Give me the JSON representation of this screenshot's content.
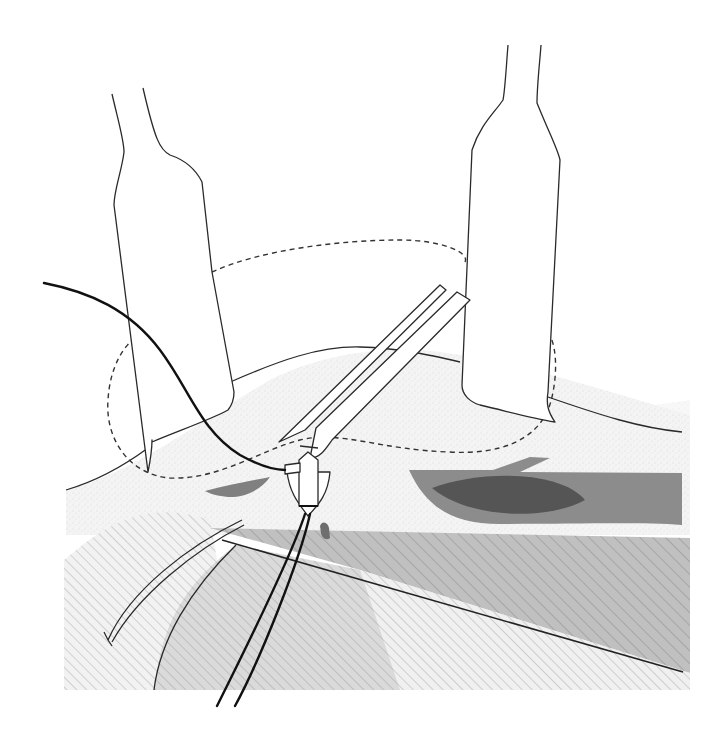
{
  "figure": {
    "type": "surgical-technique-illustration",
    "elements": {
      "left_retractor": "retractor",
      "right_retractor": "retractor",
      "forceps": "forceps",
      "anchor": "suture-anchor",
      "suture": "suture-thread",
      "incision_outline": "dashed-incision-outline",
      "needle": "curved-needle"
    },
    "layers": [
      {
        "name": "surface-tissue",
        "fill": "stippled",
        "color": "#f1f1f1"
      },
      {
        "name": "deep-layer-dark-band",
        "fill": "hatched",
        "color": "#b9b9b9"
      },
      {
        "name": "deep-layer-light",
        "fill": "hatched",
        "color": "#dcdcdc"
      },
      {
        "name": "lesion-outer",
        "fill": "solid",
        "color": "#8a8a8a"
      },
      {
        "name": "lesion-inner",
        "fill": "solid",
        "color": "#555555"
      }
    ],
    "colors": {
      "outline": "#2a2a2a",
      "thread": "#111111",
      "background": "#ffffff"
    }
  }
}
